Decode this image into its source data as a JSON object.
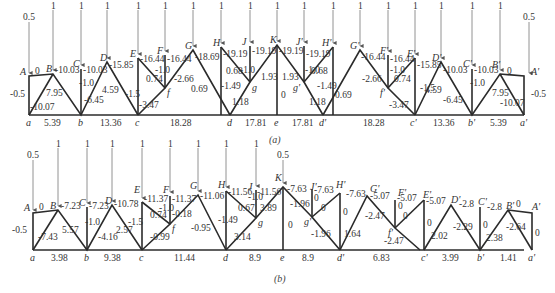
{
  "figure": {
    "caption_a": "(a)",
    "caption_b": "(b)"
  },
  "diagram_a": {
    "loads": {
      "end": "0.5",
      "mid": "1",
      "center": "1"
    },
    "nodes_bottom": [
      "a",
      "b",
      "c",
      "d",
      "e",
      "d'",
      "c'",
      "b'",
      "a'"
    ],
    "nodes_top": [
      "A",
      "B",
      "C",
      "D",
      "E",
      "F",
      "G",
      "H",
      "J",
      "K",
      "J'",
      "H'",
      "G'",
      "F'",
      "E'",
      "D'",
      "C'",
      "B'",
      "A'"
    ],
    "nodes_inner": [
      "f",
      "g",
      "g'",
      "f'"
    ],
    "bottom_chord": [
      "5.39",
      "13.36",
      "18.28",
      "17.81",
      "17.81",
      "18.28",
      "13.36",
      "5.39"
    ],
    "top_chord": [
      "0",
      "-10.03",
      "-10.03",
      "-15.85",
      "-16.44",
      "-16.44",
      "-18.69",
      "-19.19",
      "-19.19",
      "-19.19",
      "-19.19",
      "-19.19",
      "-18.69",
      "-16.44",
      "-16.44",
      "-15.85",
      "-10.03",
      "-10.03",
      "0"
    ],
    "verticals": {
      "Aa": "-0.5",
      "Cb": "-1.0",
      "Ec": "-1.5",
      "Ff": "-1.0",
      "Hd": "-1.49",
      "Jg": "-1.0",
      "Ke": "0",
      "J'g'": "-1.0",
      "H'd'": "-1.49",
      "F'f'": "-1.0",
      "E'c'": "-1.5",
      "C'b'": "-1.0",
      "A'a'": "-0.5"
    },
    "diagonals": {
      "Ba": "-10.07",
      "Bb": "7.95",
      "Db": "-6.45",
      "Dc": "4.59",
      "Ef": "0.74",
      "fc": "-3.47",
      "fG": "-2.66",
      "Gd": "0.69",
      "Hg": "0.68",
      "gd": "1.18",
      "gK": "1.93",
      "Kg'": "1.93",
      "g'H'": "0.68",
      "g'd'": "1.18",
      "d'G'": "0.69",
      "G'f'": "-2.66",
      "f'E'": "0.74",
      "f'c'": "-3.47",
      "c'D'": "4.59",
      "D'b'": "-6.45",
      "b'B'": "7.95",
      "B'a'": "-10.07"
    }
  },
  "diagram_b": {
    "loads": {
      "end": "0.5",
      "mid": "1",
      "K": "0.5"
    },
    "nodes_bottom": [
      "a",
      "b",
      "c",
      "d",
      "e",
      "d'",
      "c'",
      "b'",
      "a'"
    ],
    "nodes_top": [
      "A",
      "B",
      "C",
      "D",
      "E",
      "F",
      "G",
      "H",
      "J",
      "K",
      "J'",
      "H'",
      "G'",
      "F'",
      "E'",
      "D'",
      "C'",
      "B'",
      "A'"
    ],
    "nodes_inner": [
      "f",
      "g",
      "g'",
      "f'"
    ],
    "bottom_chord": [
      "3.98",
      "9.38",
      "11.44",
      "8.9",
      "8.9",
      "6.83",
      "3.99",
      "1.41"
    ],
    "top_chord": [
      "0",
      "-7.23",
      "-7.23",
      "-10.78",
      "-11.37",
      "-11.37",
      "-11.06",
      "-11.56",
      "-11.56",
      "-7.63",
      "-7.63",
      "-7.63",
      "-5.07",
      "-5.07",
      "-5.07",
      "-2.8",
      "-2.8",
      "0"
    ],
    "verticals": {
      "Aa": "-0.5",
      "Cb": "-1.0",
      "Ec": "-1.5",
      "Ff": "-1.0",
      "Hd": "-1.49",
      "Jg": "-1.0",
      "Ke": "0",
      "J'g'": "0",
      "H'd'": "0",
      "F'f'": "0",
      "E'c'": "0",
      "C'b'": "0",
      "A'a'": "0"
    },
    "diagonals": {
      "Ba": "-7.43",
      "Bb": "5.57",
      "Db": "-4.16",
      "Dc": "2.57",
      "Ef": "0.74",
      "fc": "-0.99",
      "fG": "-0.18",
      "Gd": "-0.95",
      "Hg": "0.67",
      "gd": "3.14",
      "gK": "3.89",
      "Kg'": "-1.96",
      "g'H'": "0",
      "g'd'": "-1.96",
      "d'G'": "1.64",
      "G'f'": "-2.47",
      "f'E'": "0",
      "f'c'": "-2.47",
      "c'D'": "2.02",
      "D'b'": "-2.29",
      "b'B'": "2.38",
      "B'a'": "-2.64"
    }
  }
}
